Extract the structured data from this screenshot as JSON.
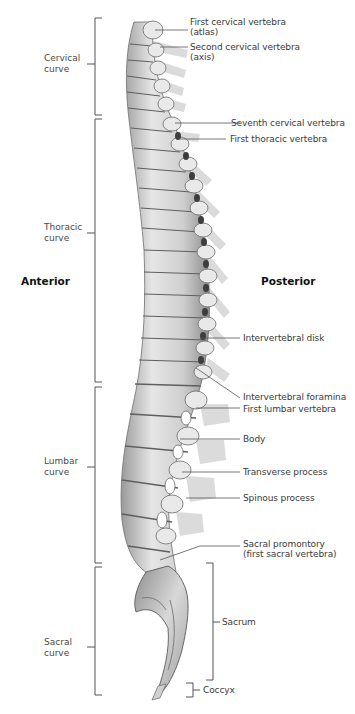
{
  "figure": {
    "orientation": {
      "anterior": "Anterior",
      "posterior": "Posterior"
    },
    "regions": [
      {
        "id": "cervical",
        "label": "Cervical\ncurve"
      },
      {
        "id": "thoracic",
        "label": "Thoracic\ncurve"
      },
      {
        "id": "lumbar",
        "label": "Lumbar\ncurve"
      },
      {
        "id": "sacral",
        "label": "Sacral\ncurve"
      }
    ],
    "structure_labels": [
      {
        "id": "c1",
        "label": "First cervical vertebra\n(atlas)"
      },
      {
        "id": "c2",
        "label": "Second cervical vertebra\n(axis)"
      },
      {
        "id": "c7",
        "label": "Seventh cervical vertebra"
      },
      {
        "id": "t1",
        "label": "First thoracic vertebra"
      },
      {
        "id": "disk",
        "label": "Intervertebral disk"
      },
      {
        "id": "foramina",
        "label": "Intervertebral foramina"
      },
      {
        "id": "l1",
        "label": "First lumbar vertebra"
      },
      {
        "id": "body",
        "label": "Body"
      },
      {
        "id": "transverse",
        "label": "Transverse process"
      },
      {
        "id": "spinous",
        "label": "Spinous process"
      },
      {
        "id": "promontory",
        "label": "Sacral promontory\n(first sacral vertebra)"
      },
      {
        "id": "sacrum",
        "label": "Sacrum"
      },
      {
        "id": "coccyx",
        "label": "Coccyx"
      }
    ],
    "colors": {
      "bone_light": "#e4e4e4",
      "bone_mid": "#bdbdbd",
      "bone_dark": "#7a7a7a",
      "process_shadow": "#c8c8c8",
      "leader_line": "#555555",
      "bracket": "#555555"
    }
  }
}
